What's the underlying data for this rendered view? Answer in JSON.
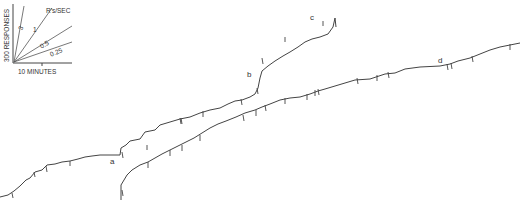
{
  "chart_data": {
    "type": "line",
    "title": "",
    "legend_key": {
      "ylabel": "300 RESPONSES",
      "xlabel": "10 MINUTES",
      "rate_unit": "R's/SEC",
      "rate_lines": [
        "3",
        "1",
        "0.5",
        "0.25"
      ]
    },
    "segment_labels": [
      "a",
      "b",
      "c",
      "d"
    ],
    "series": [
      {
        "name": "upper record",
        "points": [
          [
            0,
            197
          ],
          [
            8,
            195
          ],
          [
            14,
            191
          ],
          [
            20,
            186
          ],
          [
            26,
            180
          ],
          [
            30,
            178
          ],
          [
            35,
            172
          ],
          [
            42,
            170
          ],
          [
            47,
            165
          ],
          [
            55,
            164
          ],
          [
            62,
            162
          ],
          [
            70,
            161
          ],
          [
            78,
            159
          ],
          [
            85,
            157
          ],
          [
            92,
            156
          ],
          [
            100,
            155
          ],
          [
            110,
            155
          ],
          [
            120,
            155
          ],
          [
            121,
            148
          ],
          [
            126,
            145
          ],
          [
            130,
            141
          ],
          [
            140,
            139
          ],
          [
            145,
            132
          ],
          [
            155,
            130
          ],
          [
            160,
            125
          ],
          [
            170,
            122
          ],
          [
            180,
            119
          ],
          [
            190,
            117
          ],
          [
            200,
            113
          ],
          [
            210,
            110
          ],
          [
            220,
            108
          ],
          [
            228,
            104
          ],
          [
            235,
            101
          ],
          [
            242,
            100
          ],
          [
            250,
            97
          ],
          [
            255,
            94
          ],
          [
            258,
            88
          ],
          [
            260,
            78
          ],
          [
            262,
            71
          ],
          [
            268,
            66
          ],
          [
            275,
            61
          ],
          [
            283,
            56
          ],
          [
            290,
            52
          ],
          [
            298,
            47
          ],
          [
            305,
            42
          ],
          [
            312,
            39
          ],
          [
            320,
            37
          ],
          [
            328,
            34
          ],
          [
            333,
            27
          ],
          [
            335,
            18
          ],
          [
            336,
            27
          ]
        ]
      },
      {
        "name": "lower record",
        "points": [
          [
            121,
            200
          ],
          [
            121,
            185
          ],
          [
            124,
            180
          ],
          [
            127,
            175
          ],
          [
            132,
            170
          ],
          [
            140,
            165
          ],
          [
            148,
            162
          ],
          [
            155,
            158
          ],
          [
            162,
            154
          ],
          [
            170,
            150
          ],
          [
            178,
            146
          ],
          [
            186,
            142
          ],
          [
            194,
            138
          ],
          [
            202,
            133
          ],
          [
            210,
            128
          ],
          [
            218,
            124
          ],
          [
            226,
            121
          ],
          [
            236,
            117
          ],
          [
            245,
            113
          ],
          [
            255,
            110
          ],
          [
            262,
            107
          ],
          [
            270,
            104
          ],
          [
            280,
            100
          ],
          [
            290,
            98
          ],
          [
            300,
            97
          ],
          [
            310,
            94
          ],
          [
            318,
            91
          ],
          [
            325,
            89
          ],
          [
            335,
            86
          ],
          [
            345,
            83
          ],
          [
            355,
            80
          ],
          [
            370,
            79
          ],
          [
            385,
            74
          ],
          [
            395,
            73
          ],
          [
            405,
            69
          ],
          [
            420,
            67
          ],
          [
            440,
            66
          ],
          [
            445,
            65
          ],
          [
            450,
            64
          ],
          [
            458,
            61
          ],
          [
            470,
            58
          ],
          [
            480,
            54
          ],
          [
            490,
            50
          ],
          [
            500,
            47
          ],
          [
            510,
            45
          ],
          [
            520,
            43
          ]
        ]
      }
    ]
  }
}
